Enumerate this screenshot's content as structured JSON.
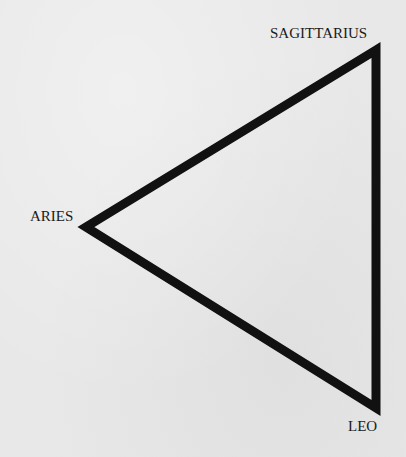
{
  "diagram": {
    "type": "triangle",
    "stroke_color": "#111111",
    "background_color": "#e8e8e8",
    "vertices": [
      {
        "name": "SAGITTARIUS",
        "x": 376,
        "y": 50
      },
      {
        "name": "ARIES",
        "x": 86,
        "y": 227
      },
      {
        "name": "LEO",
        "x": 376,
        "y": 408
      }
    ],
    "labels": {
      "top": "SAGITTARIUS",
      "left": "ARIES",
      "bottom": "LEO"
    }
  }
}
